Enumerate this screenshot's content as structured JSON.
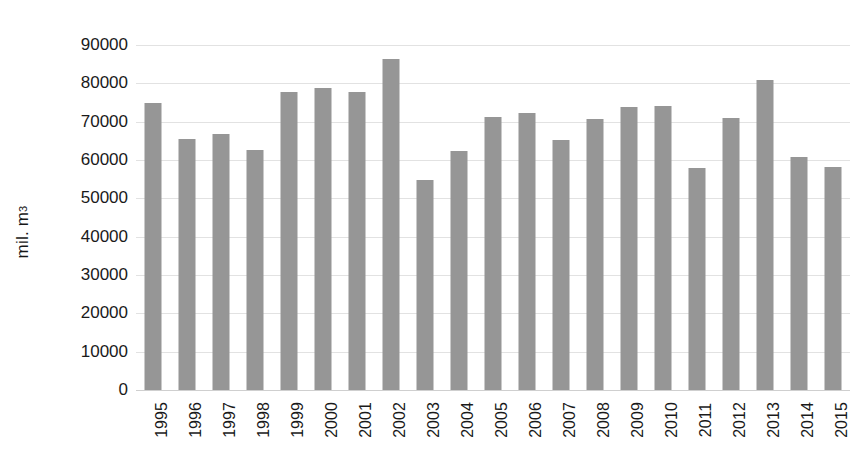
{
  "chart_data": {
    "type": "bar",
    "title": "",
    "subtitle": "",
    "xlabel": "",
    "ylabel": "mil. m3",
    "ylabel_base": "mil. m",
    "ylabel_exponent": "3",
    "ylim": [
      0,
      90000
    ],
    "ytick_step": 10000,
    "grid": true,
    "legend": false,
    "bar_color": "#969696",
    "gridline_color": "#e2e2e2",
    "categories": [
      "1995",
      "1996",
      "1997",
      "1998",
      "1999",
      "2000",
      "2001",
      "2002",
      "2003",
      "2004",
      "2005",
      "2006",
      "2007",
      "2008",
      "2009",
      "2010",
      "2011",
      "2012",
      "2013",
      "2014",
      "2015"
    ],
    "values": [
      74800,
      65500,
      66700,
      62600,
      77800,
      78700,
      77700,
      86300,
      54900,
      62400,
      71200,
      72300,
      65300,
      70800,
      73700,
      74000,
      58000,
      71000,
      81000,
      60900,
      58200
    ],
    "ytick_labels": [
      "0",
      "10000",
      "20000",
      "30000",
      "40000",
      "50000",
      "60000",
      "70000",
      "80000",
      "90000"
    ],
    "ytick_values": [
      0,
      10000,
      20000,
      30000,
      40000,
      50000,
      60000,
      70000,
      80000,
      90000
    ]
  }
}
